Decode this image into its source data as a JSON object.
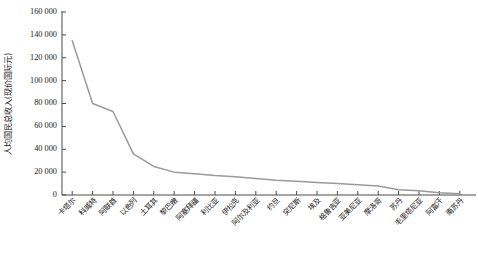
{
  "chart_data": {
    "type": "line",
    "title": "",
    "xlabel": "",
    "ylabel": "人均国民总收入(现价国际元)",
    "ylim": [
      0,
      160000
    ],
    "ytick_values": [
      0,
      20000,
      40000,
      60000,
      80000,
      100000,
      120000,
      140000,
      160000
    ],
    "ytick_labels": [
      "0",
      "20 000",
      "40 000",
      "60 000",
      "80 000",
      "100 000",
      "120 000",
      "140 000",
      "160 000"
    ],
    "grid": false,
    "legend": false,
    "line_color": "#9a9a9a",
    "axis_color": "#4a4a4a",
    "categories": [
      "卡塔尔",
      "科威特",
      "阿联酋",
      "以色列",
      "土耳其",
      "黎巴嫩",
      "阿塞拜疆",
      "利比亚",
      "伊拉克",
      "阿尔及利亚",
      "约旦",
      "突尼斯",
      "埃及",
      "格鲁吉亚",
      "亚美尼亚",
      "摩洛哥",
      "苏丹",
      "毛里塔尼亚",
      "阿富汗",
      "南苏丹"
    ],
    "values": [
      135000,
      80000,
      73000,
      36000,
      25000,
      20000,
      18500,
      17000,
      16000,
      14500,
      13000,
      12000,
      11000,
      10000,
      9000,
      7800,
      4500,
      3800,
      2000,
      1200
    ],
    "series": [
      {
        "name": "人均国民总收入",
        "values": [
          135000,
          80000,
          73000,
          36000,
          25000,
          20000,
          18500,
          17000,
          16000,
          14500,
          13000,
          12000,
          11000,
          10000,
          9000,
          7800,
          4500,
          3800,
          2000,
          1200
        ]
      }
    ]
  },
  "layout": {
    "plot_left": 62,
    "plot_right": 470,
    "plot_top": 12,
    "plot_bottom": 195
  }
}
